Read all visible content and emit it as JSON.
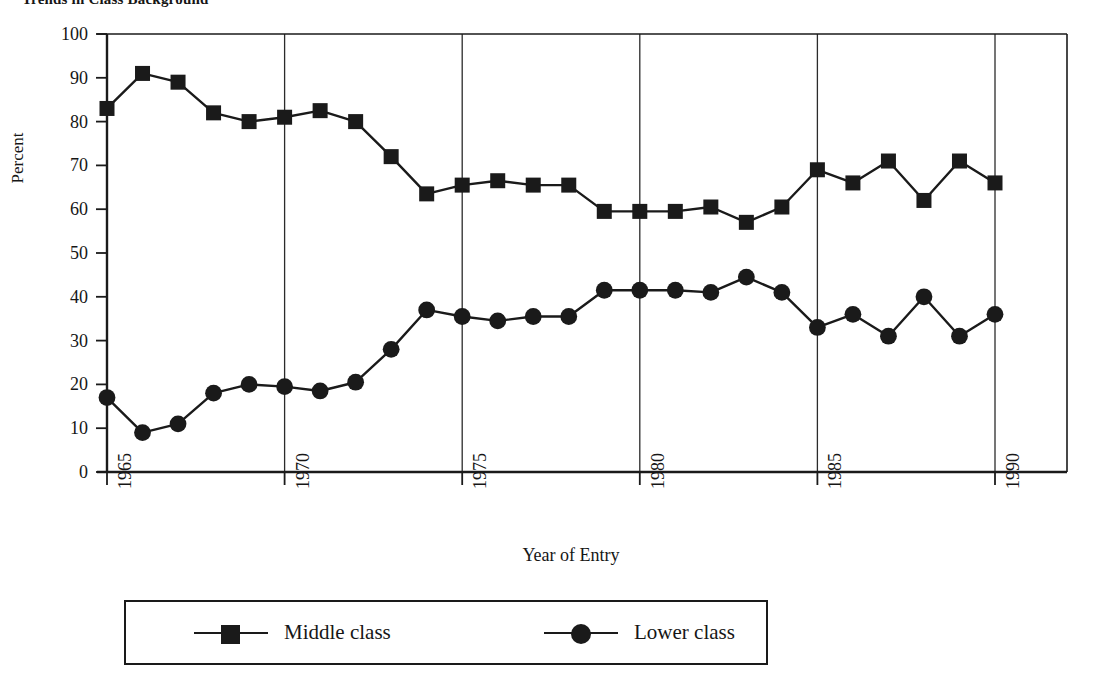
{
  "chart_data": {
    "type": "line",
    "title": "Trends in Class Background",
    "xlabel": "Year of Entry",
    "ylabel": "Percent",
    "ylim": [
      0,
      100
    ],
    "xlim": [
      1965,
      1990
    ],
    "yticks": [
      0,
      10,
      20,
      30,
      40,
      50,
      60,
      70,
      80,
      90,
      100
    ],
    "xticks": [
      1965,
      1970,
      1975,
      1980,
      1985,
      1990
    ],
    "grid": "vertical-only",
    "legend_position": "bottom",
    "x": [
      1965,
      1966,
      1967,
      1968,
      1969,
      1970,
      1971,
      1972,
      1973,
      1974,
      1975,
      1976,
      1977,
      1978,
      1979,
      1980,
      1981,
      1982,
      1983,
      1984,
      1985,
      1986,
      1987,
      1988,
      1989,
      1990
    ],
    "series": [
      {
        "name": "Middle class",
        "marker": "square",
        "color": "#1a1a1a",
        "values": [
          83,
          91,
          89,
          82,
          80,
          81,
          82.5,
          80,
          72,
          63.5,
          65.5,
          66.5,
          65.5,
          65.5,
          59.5,
          59.5,
          59.5,
          60.5,
          57,
          60.5,
          69,
          66,
          71,
          62,
          71,
          66
        ]
      },
      {
        "name": "Lower class",
        "marker": "circle",
        "color": "#1a1a1a",
        "values": [
          17,
          9,
          11,
          18,
          20,
          19.5,
          18.5,
          20.5,
          28,
          37,
          35.5,
          34.5,
          35.5,
          35.5,
          41.5,
          41.5,
          41.5,
          41,
          44.5,
          41,
          33,
          36,
          31,
          40,
          31,
          36
        ]
      }
    ]
  },
  "legend": {
    "middle_label": "Middle class",
    "lower_label": "Lower class"
  }
}
